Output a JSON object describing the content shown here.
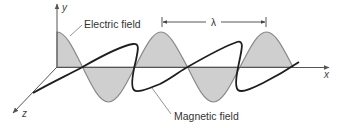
{
  "diagram": {
    "labels": {
      "electric_field": "Electric field",
      "magnetic_field": "Magnetic field",
      "wavelength": "λ"
    },
    "axes": {
      "x": "x",
      "y": "y",
      "z": "z"
    },
    "colors": {
      "electric_fill": "#cfcfcf",
      "electric_stroke": "#8a8a8a",
      "magnetic_stroke": "#1e1e1e",
      "axis": "#555555",
      "leader": "#777777"
    }
  }
}
